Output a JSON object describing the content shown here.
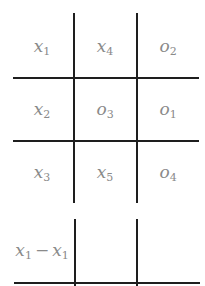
{
  "grid": {
    "rows": [
      [
        {
          "v": "x",
          "s": "1"
        },
        {
          "v": "x",
          "s": "4"
        },
        {
          "v": "o",
          "s": "2"
        }
      ],
      [
        {
          "v": "x",
          "s": "2"
        },
        {
          "v": "o",
          "s": "3"
        },
        {
          "v": "o",
          "s": "1"
        }
      ],
      [
        {
          "v": "x",
          "s": "3"
        },
        {
          "v": "x",
          "s": "5"
        },
        {
          "v": "o",
          "s": "4"
        }
      ]
    ],
    "extra_row": {
      "left": {
        "v1": "x",
        "s1": "1",
        "op": "−",
        "v2": "x",
        "s2": "1"
      }
    }
  },
  "colors": {
    "line": "#1e1e1e",
    "text": "#8a8a8a",
    "background": "#ffffff"
  }
}
